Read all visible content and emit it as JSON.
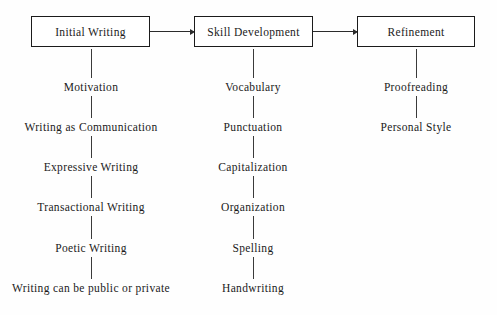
{
  "diagram": {
    "background_color": "#fefefe",
    "line_color": "#2b2b2b",
    "text_color": "#1b1b1b",
    "stages": [
      {
        "id": "initial-writing",
        "label": "Initial Writing",
        "box": {
          "x": 31,
          "y": 16,
          "width": 119,
          "height": 31
        },
        "column_center_x": 91,
        "items": [
          {
            "label": "Motivation",
            "y": 87
          },
          {
            "label": "Writing as Communication",
            "y": 127
          },
          {
            "label": "Expressive Writing",
            "y": 167
          },
          {
            "label": "Transactional Writing",
            "y": 207
          },
          {
            "label": "Poetic Writing",
            "y": 248
          },
          {
            "label": "Writing can be public or private",
            "y": 288
          }
        ]
      },
      {
        "id": "skill-development",
        "label": "Skill Development",
        "box": {
          "x": 194,
          "y": 16,
          "width": 119,
          "height": 31
        },
        "column_center_x": 253,
        "items": [
          {
            "label": "Vocabulary",
            "y": 87
          },
          {
            "label": "Punctuation",
            "y": 127
          },
          {
            "label": "Capitalization",
            "y": 167
          },
          {
            "label": "Organization",
            "y": 207
          },
          {
            "label": "Spelling",
            "y": 248
          },
          {
            "label": "Handwriting",
            "y": 288
          }
        ]
      },
      {
        "id": "refinement",
        "label": "Refinement",
        "box": {
          "x": 357,
          "y": 16,
          "width": 118,
          "height": 31
        },
        "column_center_x": 416,
        "items": [
          {
            "label": "Proofreading",
            "y": 87
          },
          {
            "label": "Personal Style",
            "y": 127
          }
        ]
      }
    ],
    "arrows": [
      {
        "id": "arrow-initial-to-skill",
        "x": 150,
        "y": 31,
        "width": 44
      },
      {
        "id": "arrow-skill-to-refinement",
        "x": 313,
        "y": 31,
        "width": 44
      }
    ]
  }
}
